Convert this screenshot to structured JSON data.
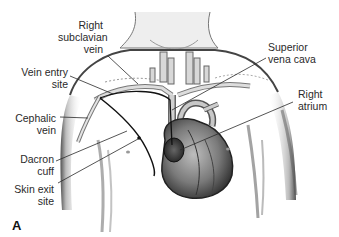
{
  "figure": {
    "panel_letter": "A",
    "labels": {
      "right_subclavian_vein": [
        "Right",
        "subclavian",
        "vein"
      ],
      "vein_entry_site": [
        "Vein entry",
        "site"
      ],
      "cephalic_vein": [
        "Cephalic",
        "vein"
      ],
      "dacron_cuff": [
        "Dacron",
        "cuff"
      ],
      "skin_exit_site": [
        "Skin exit",
        "site"
      ],
      "superior_vena_cava": [
        "Superior",
        "vena cava"
      ],
      "right_atrium": [
        "Right",
        "atrium"
      ]
    },
    "colors": {
      "ink": "#2a2a2a",
      "skin_shade": "#9a9a9a",
      "heart_dark": "#3a3a3a",
      "catheter": "#111111"
    }
  }
}
